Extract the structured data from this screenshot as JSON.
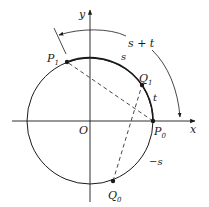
{
  "diagram": {
    "axes": {
      "x_label": "x",
      "y_label": "y",
      "origin_label": "O"
    },
    "points": [
      {
        "id": "P0",
        "label": "P",
        "sub": "0"
      },
      {
        "id": "P1",
        "label": "P",
        "sub": "1"
      },
      {
        "id": "Q0",
        "label": "Q",
        "sub": "0"
      },
      {
        "id": "Q1",
        "label": "Q",
        "sub": "1"
      }
    ],
    "arc_labels": {
      "s": "s",
      "t": "t",
      "neg_s": "−s",
      "s_plus_t": "s + t"
    },
    "colors": {
      "stroke": "#1a1a1a",
      "background": "#ffffff"
    }
  }
}
